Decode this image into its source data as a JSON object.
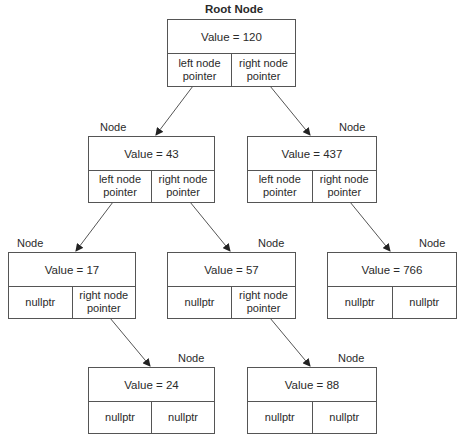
{
  "diagram": {
    "type": "binary-search-tree",
    "root_label": "Root Node",
    "node_label": "Node",
    "nodes": [
      {
        "id": "n120",
        "label": "Root Node",
        "value_text": "Value = 120",
        "left": "left node\npointer",
        "right": "right node\npointer"
      },
      {
        "id": "n43",
        "label": "Node",
        "value_text": "Value = 43",
        "left": "left node\npointer",
        "right": "right node\npointer"
      },
      {
        "id": "n437",
        "label": "Node",
        "value_text": "Value = 437",
        "left": "left node\npointer",
        "right": "right node\npointer"
      },
      {
        "id": "n17",
        "label": "Node",
        "value_text": "Value = 17",
        "left": "nullptr",
        "right": "right node\npointer"
      },
      {
        "id": "n57",
        "label": "Node",
        "value_text": "Value = 57",
        "left": "nullptr",
        "right": "right node\npointer"
      },
      {
        "id": "n766",
        "label": "Node",
        "value_text": "Value = 766",
        "left": "nullptr",
        "right": "nullptr"
      },
      {
        "id": "n24",
        "label": "Node",
        "value_text": "Value = 24",
        "left": "nullptr",
        "right": "nullptr"
      },
      {
        "id": "n88",
        "label": "Node",
        "value_text": "Value = 88",
        "left": "nullptr",
        "right": "nullptr"
      }
    ],
    "edges": [
      {
        "from": "n120",
        "side": "left",
        "to": "n43"
      },
      {
        "from": "n120",
        "side": "right",
        "to": "n437"
      },
      {
        "from": "n43",
        "side": "left",
        "to": "n17"
      },
      {
        "from": "n43",
        "side": "right",
        "to": "n57"
      },
      {
        "from": "n437",
        "side": "right",
        "to": "n766"
      },
      {
        "from": "n17",
        "side": "right",
        "to": "n24"
      },
      {
        "from": "n57",
        "side": "right",
        "to": "n88"
      }
    ],
    "colors": {
      "line": "#555555",
      "text": "#2a2a2a",
      "background": "#ffffff"
    }
  }
}
